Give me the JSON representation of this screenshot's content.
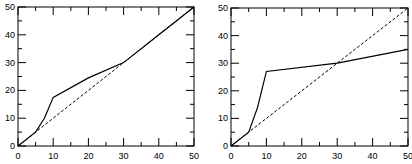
{
  "chart_data": [
    {
      "type": "line",
      "title": "",
      "xlabel": "",
      "ylabel": "",
      "xlim": [
        0,
        50
      ],
      "ylim": [
        0,
        50
      ],
      "xticks": [
        0,
        10,
        20,
        30,
        40,
        50
      ],
      "yticks": [
        0,
        10,
        20,
        30,
        40,
        50
      ],
      "grid": false,
      "legend": null,
      "series": [
        {
          "name": "solid",
          "style": "solid",
          "x": [
            0,
            5,
            7.5,
            10,
            20,
            30,
            40,
            50
          ],
          "y": [
            0,
            5,
            10,
            17.5,
            24.5,
            30,
            40,
            50
          ]
        },
        {
          "name": "dashed",
          "style": "dashed",
          "x": [
            0,
            50
          ],
          "y": [
            0,
            50
          ]
        }
      ]
    },
    {
      "type": "line",
      "title": "",
      "xlabel": "",
      "ylabel": "",
      "xlim": [
        0,
        50
      ],
      "ylim": [
        0,
        50
      ],
      "xticks": [
        0,
        10,
        20,
        30,
        40,
        50
      ],
      "yticks": [
        0,
        10,
        20,
        30,
        40,
        50
      ],
      "grid": false,
      "legend": null,
      "series": [
        {
          "name": "solid",
          "style": "solid",
          "x": [
            0,
            5,
            7.5,
            10,
            30,
            50
          ],
          "y": [
            0,
            5,
            14,
            27,
            30,
            35
          ]
        },
        {
          "name": "dashed",
          "style": "dashed",
          "x": [
            0,
            50
          ],
          "y": [
            0,
            50
          ]
        }
      ]
    }
  ]
}
